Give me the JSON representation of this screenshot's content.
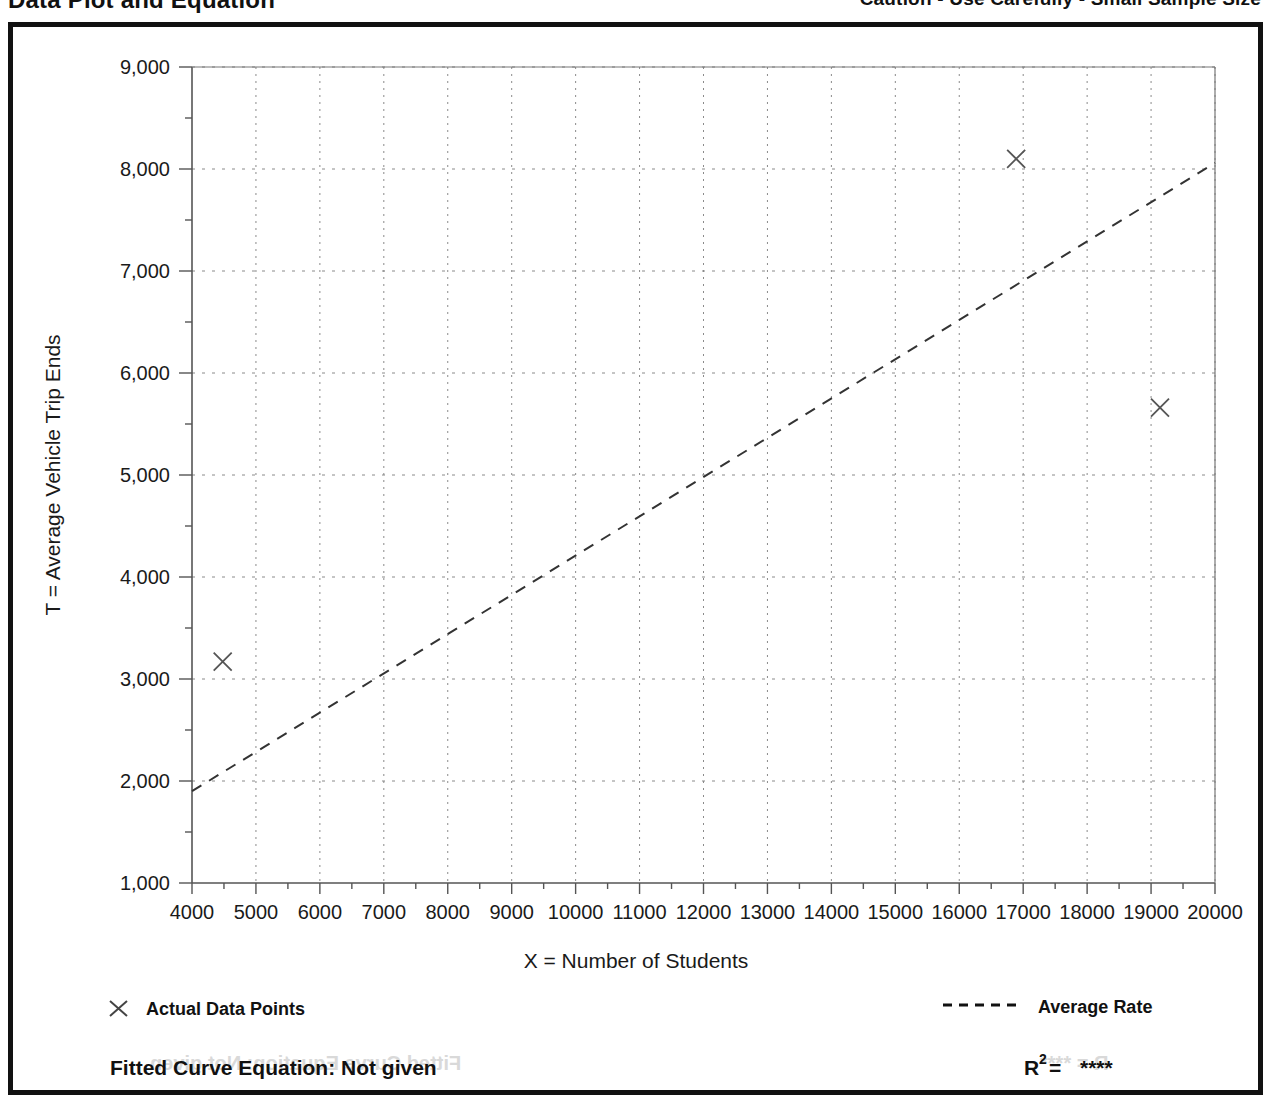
{
  "header": {
    "title": "Data Plot and Equation",
    "caution": "Caution - Use Carefully - Small Sample Size"
  },
  "footer": {
    "equation_label": "Fitted Curve Equation:  Not given",
    "r_label": "R",
    "r_exponent": "2",
    "r_equals": " = ",
    "r_value": "****"
  },
  "legend": {
    "points_label": "Actual Data Points",
    "line_label": "Average Rate",
    "marker_icon": "x-marker-icon",
    "line_icon": "dashed-line-icon"
  },
  "ghost": {
    "left": "Fitted Curve Equation: Not given",
    "right": "R  = ****"
  },
  "chart_data": {
    "type": "scatter",
    "title": "Data Plot and Equation",
    "xlabel": "X = Number of Students",
    "ylabel": "T = Average Vehicle Trip Ends",
    "xlim": [
      4000,
      20000
    ],
    "ylim": [
      1000,
      9000
    ],
    "x_major_step": 1000,
    "y_major_step": 1000,
    "x_minor_step": 500,
    "y_minor_step": 500,
    "grid": true,
    "grid_style": "dotted",
    "legend_position": "below-plot",
    "xticks": [
      4000,
      5000,
      6000,
      7000,
      8000,
      9000,
      10000,
      11000,
      12000,
      13000,
      14000,
      15000,
      16000,
      17000,
      18000,
      19000,
      20000
    ],
    "xticklabels": [
      "4000",
      "5000",
      "6000",
      "7000",
      "8000",
      "9000",
      "10000",
      "11000",
      "12000",
      "13000",
      "14000",
      "15000",
      "16000",
      "17000",
      "18000",
      "19000",
      "20000"
    ],
    "yticks": [
      1000,
      2000,
      3000,
      4000,
      5000,
      6000,
      7000,
      8000,
      9000
    ],
    "yticklabels": [
      "1,000",
      "2,000",
      "3,000",
      "4,000",
      "5,000",
      "6,000",
      "7,000",
      "8,000",
      "9,000"
    ],
    "series": [
      {
        "name": "Actual Data Points",
        "type": "scatter",
        "marker": "x",
        "points": [
          {
            "x": 4480,
            "y": 3170
          },
          {
            "x": 16890,
            "y": 8100
          },
          {
            "x": 19140,
            "y": 5660
          }
        ]
      },
      {
        "name": "Average Rate",
        "type": "line",
        "style": "dashed",
        "points": [
          {
            "x": 4000,
            "y": 1900
          },
          {
            "x": 20000,
            "y": 8060
          }
        ]
      }
    ]
  }
}
